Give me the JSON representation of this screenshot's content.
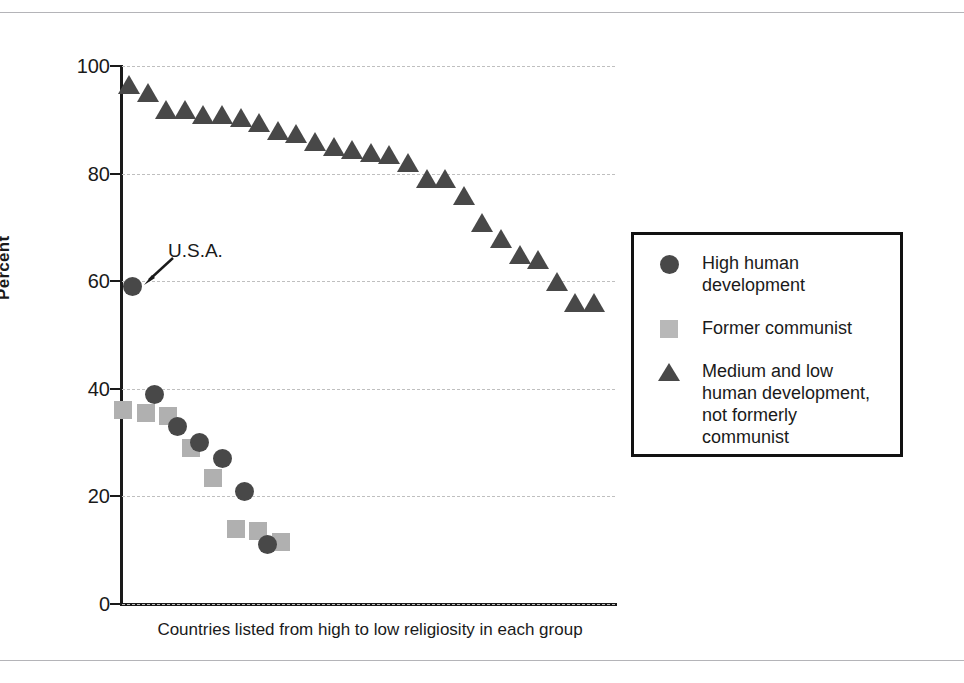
{
  "chart_data": {
    "type": "scatter",
    "title": "",
    "xlabel": "Countries listed from high to low religiosity in each group",
    "ylabel": "Percent",
    "ylim": [
      0,
      100
    ],
    "yticks": [
      0,
      20,
      40,
      60,
      80,
      100
    ],
    "ytick_labels": [
      "0",
      "20",
      "40",
      "60",
      "80",
      "100"
    ],
    "grid": "horizontal dashed",
    "legend_position": "right",
    "annotations": [
      {
        "text": "U.S.A.",
        "series": "High human development",
        "point_index": 0,
        "value": 59
      }
    ],
    "series": [
      {
        "name": "High human development",
        "marker": "circle",
        "color": "#484848",
        "x": [
          1,
          2,
          3,
          4,
          5,
          6,
          7
        ],
        "values": [
          59,
          39,
          33,
          30,
          27,
          21,
          11
        ]
      },
      {
        "name": "Former communist",
        "marker": "square",
        "color": "#b0b0b0",
        "x": [
          1,
          2,
          3,
          4,
          5,
          6,
          7,
          8
        ],
        "values": [
          36,
          35.5,
          35,
          29,
          23.5,
          14,
          13.5,
          11.5
        ]
      },
      {
        "name": "Medium and low human development, not formerly communist",
        "marker": "triangle",
        "color": "#484848",
        "x": [
          1,
          2,
          3,
          4,
          5,
          6,
          7,
          8,
          9,
          10,
          11,
          12,
          13,
          14,
          15,
          16,
          17,
          18,
          19,
          20,
          21,
          22,
          23,
          24,
          25,
          26
        ],
        "values": [
          96.5,
          95,
          92,
          92,
          91,
          91,
          90.5,
          89.5,
          88,
          87.5,
          86,
          85,
          84.5,
          84,
          83.5,
          82,
          79,
          79,
          76,
          71,
          68,
          65,
          64,
          60,
          56,
          56
        ]
      }
    ]
  },
  "legend": {
    "entries": [
      {
        "marker": "circle",
        "label": "High human\ndevelopment"
      },
      {
        "marker": "square",
        "label": "Former communist"
      },
      {
        "marker": "triangle",
        "label": "Medium and low\nhuman development,\nnot formerly\ncommunist"
      }
    ]
  },
  "axes": {
    "y_title": "Percent",
    "x_title": "Countries listed from high to low religiosity in each group",
    "y_tick_labels": [
      "100",
      "80",
      "60",
      "40",
      "20",
      "0"
    ]
  }
}
